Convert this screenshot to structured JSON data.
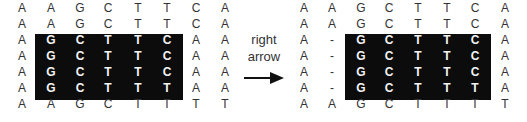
{
  "left_alignment": {
    "rows": [
      [
        "A",
        "A",
        "G",
        "C",
        "T",
        "T",
        "C",
        "A"
      ],
      [
        "A",
        "A",
        "G",
        "C",
        "T",
        "T",
        "C",
        "A"
      ],
      [
        "A",
        "G",
        "C",
        "T",
        "T",
        "C",
        "A",
        "A"
      ],
      [
        "A",
        "G",
        "C",
        "T",
        "T",
        "C",
        "A",
        "A"
      ],
      [
        "A",
        "G",
        "C",
        "T",
        "T",
        "C",
        "A",
        "A"
      ],
      [
        "A",
        "G",
        "C",
        "T",
        "T",
        "T",
        "A",
        "A"
      ],
      [
        "A",
        "A",
        "G",
        "C",
        "T",
        "T",
        "T",
        "T"
      ]
    ],
    "highlight": {
      "row_start": 2,
      "row_end": 5,
      "col_start": 1,
      "col_end": 5
    }
  },
  "transition": {
    "label_line1": "right",
    "label_line2": "arrow",
    "arrow_icon": "arrow-right"
  },
  "right_alignment": {
    "rows": [
      [
        "A",
        "A",
        "G",
        "C",
        "T",
        "T",
        "C",
        "A"
      ],
      [
        "A",
        "A",
        "G",
        "C",
        "T",
        "T",
        "C",
        "A"
      ],
      [
        "A",
        "-",
        "G",
        "C",
        "T",
        "T",
        "C",
        "A"
      ],
      [
        "A",
        "-",
        "G",
        "C",
        "T",
        "T",
        "C",
        "A"
      ],
      [
        "A",
        "-",
        "G",
        "C",
        "T",
        "T",
        "C",
        "A"
      ],
      [
        "A",
        "-",
        "G",
        "C",
        "T",
        "T",
        "T",
        "A"
      ],
      [
        "A",
        "A",
        "G",
        "C",
        "T",
        "T",
        "T",
        "T"
      ]
    ],
    "highlight": {
      "row_start": 2,
      "row_end": 5,
      "col_start": 2,
      "col_end": 6
    }
  },
  "colors": {
    "highlight_bg": "#0c0c0c",
    "highlight_text": "#f2f2f2",
    "text": "#333333"
  }
}
